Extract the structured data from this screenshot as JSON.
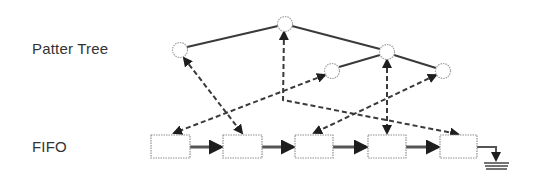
{
  "labels": {
    "tree": "Patter Tree",
    "fifo": "FIFO"
  },
  "colors": {
    "line": "#2a2a2a",
    "node_stroke": "#9a9a9a",
    "box_stroke": "#8a8a8a",
    "text": "#333333"
  },
  "tree": {
    "nodes": [
      {
        "id": "n1",
        "cx": 180,
        "cy": 50
      },
      {
        "id": "root",
        "cx": 285,
        "cy": 24
      },
      {
        "id": "n3",
        "cx": 332,
        "cy": 71
      },
      {
        "id": "n4",
        "cx": 387,
        "cy": 52
      },
      {
        "id": "n5",
        "cx": 443,
        "cy": 71
      }
    ],
    "edges": [
      [
        "n1",
        "root"
      ],
      [
        "root",
        "n4"
      ],
      [
        "n3",
        "n4"
      ],
      [
        "n4",
        "n5"
      ]
    ]
  },
  "fifo": {
    "boxes": [
      {
        "id": "b1",
        "x": 151,
        "y": 135,
        "w": 39,
        "h": 23
      },
      {
        "id": "b2",
        "x": 223,
        "y": 135,
        "w": 39,
        "h": 23
      },
      {
        "id": "b3",
        "x": 295,
        "y": 135,
        "w": 38,
        "h": 23
      },
      {
        "id": "b4",
        "x": 368,
        "y": 135,
        "w": 38,
        "h": 23
      },
      {
        "id": "b5",
        "x": 440,
        "y": 135,
        "w": 37,
        "h": 23
      }
    ],
    "terminal": "ground-symbol"
  },
  "pointers": [
    {
      "from": "n1",
      "to": "b2",
      "bidirectional": true
    },
    {
      "from": "n3",
      "to": "b1",
      "bidirectional": true
    },
    {
      "from": "root",
      "to": "b5",
      "bidirectional": true,
      "via": "bend"
    },
    {
      "from": "n4",
      "to": "b4",
      "bidirectional": true
    },
    {
      "from": "n5",
      "to": "b3",
      "bidirectional": true
    }
  ]
}
